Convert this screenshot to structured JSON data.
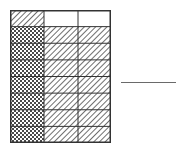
{
  "figure": {
    "rows": 8,
    "columns": 3,
    "cells": [
      [
        "diagonal",
        "blank",
        "blank"
      ],
      [
        "crosshatch",
        "diagonal",
        "diagonal"
      ],
      [
        "crosshatch",
        "diagonal",
        "diagonal"
      ],
      [
        "crosshatch",
        "diagonal",
        "diagonal"
      ],
      [
        "crosshatch",
        "diagonal",
        "diagonal"
      ],
      [
        "crosshatch",
        "diagonal",
        "diagonal"
      ],
      [
        "crosshatch",
        "diagonal",
        "diagonal"
      ],
      [
        "crosshatch",
        "diagonal",
        "diagonal"
      ]
    ],
    "colors": {
      "border": "#333333",
      "pattern": "#555555",
      "background": "#ffffff"
    }
  },
  "answer_line": {
    "label": ""
  }
}
